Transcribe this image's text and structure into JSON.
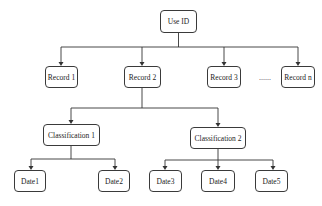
{
  "diagram": {
    "type": "tree",
    "root": {
      "id": "use_id",
      "label": "Use ID"
    },
    "records": [
      {
        "id": "record_1",
        "label": "Record 1"
      },
      {
        "id": "record_2",
        "label": "Record 2"
      },
      {
        "id": "record_3",
        "label": "Record 3"
      },
      {
        "id": "record_n",
        "label": "Record n"
      }
    ],
    "ellipsis": "......",
    "classifications": [
      {
        "id": "classification_1",
        "label": "Classification 1",
        "parent": "record_2"
      },
      {
        "id": "classification_2",
        "label": "Classification 2",
        "parent": "record_2"
      }
    ],
    "dates": [
      {
        "id": "date1",
        "label": "Date1",
        "parent": "classification_1"
      },
      {
        "id": "date2",
        "label": "Date2",
        "parent": "classification_1"
      },
      {
        "id": "date3",
        "label": "Date3",
        "parent": "classification_2"
      },
      {
        "id": "date4",
        "label": "Date4",
        "parent": "classification_2"
      },
      {
        "id": "date5",
        "label": "Date5",
        "parent": "classification_2"
      }
    ],
    "edges": [
      [
        "use_id",
        "record_1"
      ],
      [
        "use_id",
        "record_2"
      ],
      [
        "use_id",
        "record_3"
      ],
      [
        "use_id",
        "record_n"
      ],
      [
        "record_2",
        "classification_1"
      ],
      [
        "record_2",
        "classification_2"
      ],
      [
        "classification_1",
        "date1"
      ],
      [
        "classification_1",
        "date2"
      ],
      [
        "classification_2",
        "date3"
      ],
      [
        "classification_2",
        "date4"
      ],
      [
        "classification_2",
        "date5"
      ]
    ],
    "colors": {
      "stroke": "#333333",
      "fill": "#ffffff",
      "text": "#222222"
    }
  }
}
